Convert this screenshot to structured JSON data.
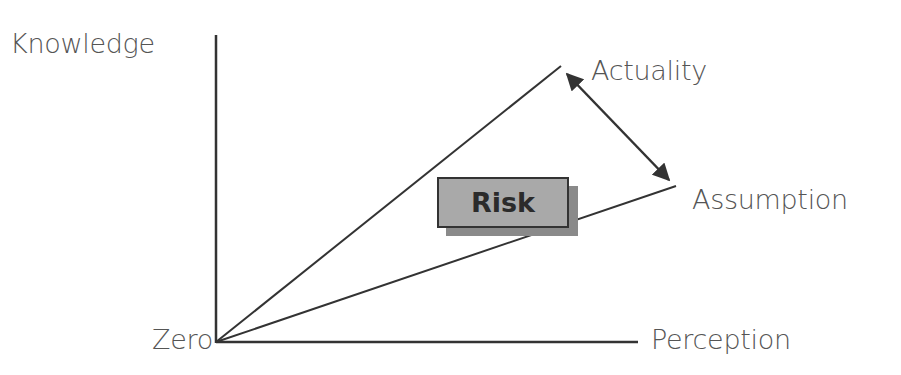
{
  "diagram": {
    "axes": {
      "y_label": "Knowledge",
      "x_label": "Perception",
      "origin_label": "Zero"
    },
    "lines": [
      {
        "name": "Actuality",
        "label": "Actuality"
      },
      {
        "name": "Assumption",
        "label": "Assumption"
      }
    ],
    "gap_box": {
      "label": "Risk"
    },
    "colors": {
      "line": "#333333",
      "text": "#555555",
      "box_fill": "#a9a9a9",
      "box_shadow": "#8a8a8a"
    }
  }
}
